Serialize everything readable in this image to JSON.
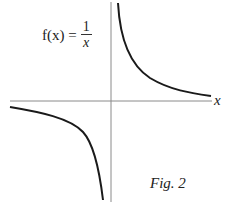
{
  "figure": {
    "formula": {
      "lhs": "f(x) =",
      "numerator": "1",
      "denominator": "x"
    },
    "x_axis_label": "x",
    "caption": "Fig. 2"
  },
  "colors": {
    "curve": "#1a1a1a",
    "axis": "#8a8a8a",
    "background": "#ffffff"
  }
}
